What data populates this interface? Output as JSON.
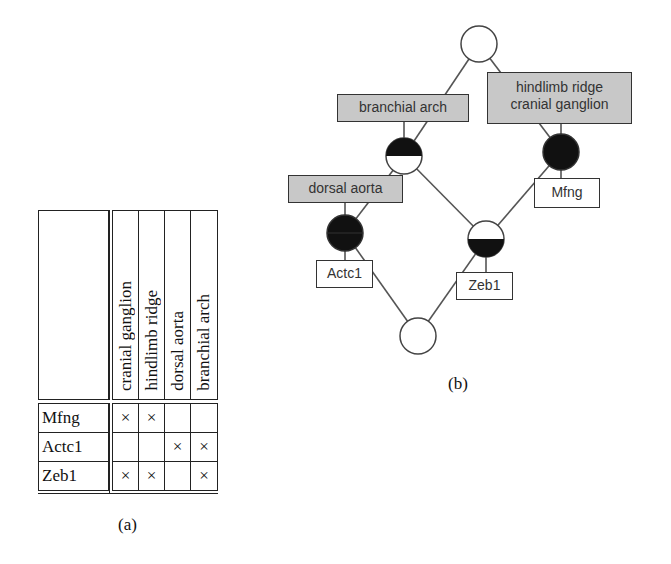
{
  "context_table": {
    "attributes": [
      "cranial ganglion",
      "hindlimb ridge",
      "dorsal aorta",
      "branchial arch"
    ],
    "objects": [
      {
        "name": "Mfng",
        "marks": [
          "×",
          "×",
          "",
          ""
        ]
      },
      {
        "name": "Actc1",
        "marks": [
          "",
          "",
          "×",
          "×"
        ]
      },
      {
        "name": "Zeb1",
        "marks": [
          "×",
          "×",
          "",
          "×"
        ]
      }
    ],
    "caption": "(a)"
  },
  "lattice": {
    "caption": "(b)",
    "attribute_labels": {
      "branchial_arch": "branchial arch",
      "hindlimb_cranial_line1": "hindlimb ridge",
      "hindlimb_cranial_line2": "cranial ganglion",
      "dorsal_aorta": "dorsal aorta"
    },
    "object_labels": {
      "mfng": "Mfng",
      "actc1": "Actc1",
      "zeb1": "Zeb1"
    },
    "colors": {
      "attribute_label_fill": "#c8c8c8",
      "node_dark": "#111111",
      "edge": "#555555"
    }
  }
}
